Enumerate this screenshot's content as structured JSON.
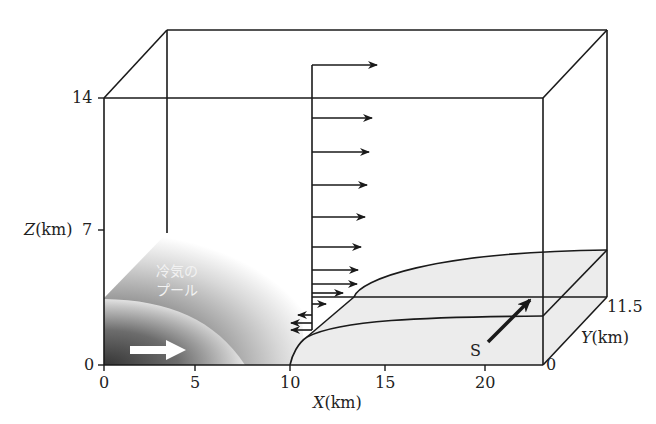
{
  "figure": {
    "type": "3d-schematic",
    "labels": {
      "z_axis": "Z(km)",
      "z_axis_var": "Z",
      "z_axis_unit": "(km)",
      "x_axis": "X(km)",
      "x_axis_var": "X",
      "x_axis_unit": "(km)",
      "y_axis": "Y(km)",
      "y_axis_var": "Y",
      "y_axis_unit": "(km)",
      "cold_pool_line1": "冷気の",
      "cold_pool_line2": "プール",
      "s_label": "S"
    },
    "z_ticks": [
      "0",
      "7",
      "14"
    ],
    "x_ticks": [
      "0",
      "5",
      "10",
      "15",
      "20"
    ],
    "y_ticks": [
      "0",
      "11.5"
    ],
    "colors": {
      "line": "#1a1a1a",
      "cold_pool_dark": "#3a3a3a",
      "cold_pool_light": "#ffffff",
      "surface_fill": "#ececec",
      "arrow_white": "#ffffff"
    }
  }
}
